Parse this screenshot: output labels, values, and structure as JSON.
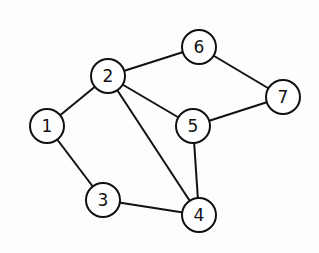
{
  "graph": {
    "nodes": [
      {
        "id": "1",
        "label": "1",
        "x": 47,
        "y": 126
      },
      {
        "id": "2",
        "label": "2",
        "x": 108,
        "y": 76
      },
      {
        "id": "3",
        "label": "3",
        "x": 103,
        "y": 200
      },
      {
        "id": "4",
        "label": "4",
        "x": 199,
        "y": 215
      },
      {
        "id": "5",
        "label": "5",
        "x": 193,
        "y": 126
      },
      {
        "id": "6",
        "label": "6",
        "x": 199,
        "y": 47
      },
      {
        "id": "7",
        "label": "7",
        "x": 283,
        "y": 97
      }
    ],
    "edges": [
      [
        "1",
        "2"
      ],
      [
        "1",
        "3"
      ],
      [
        "2",
        "6"
      ],
      [
        "2",
        "5"
      ],
      [
        "2",
        "4"
      ],
      [
        "3",
        "4"
      ],
      [
        "5",
        "4"
      ],
      [
        "5",
        "7"
      ],
      [
        "6",
        "7"
      ]
    ],
    "node_radius": 17,
    "stroke_color": "#111111"
  }
}
